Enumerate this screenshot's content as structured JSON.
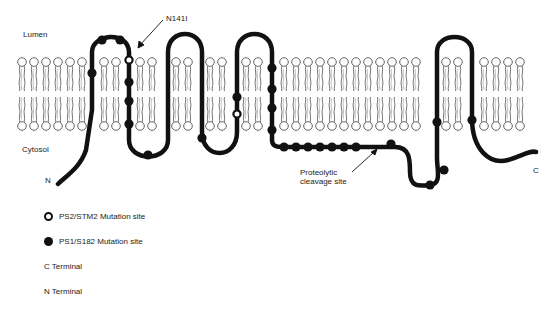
{
  "figure": {
    "compartments": {
      "lumen": "Lumen",
      "cytosol": "Cytosol"
    },
    "termini": {
      "n": "N",
      "c": "C"
    },
    "annotations": {
      "mutation_callout": "N141I",
      "cleavage_line1": "Proteolytic",
      "cleavage_line2": "cleavage site"
    },
    "legend": {
      "items": [
        {
          "symbol": "open-circle",
          "label": "PS2/STM2 Mutation site"
        },
        {
          "symbol": "filled-circle",
          "label": "PS1/S182 Mutation site"
        },
        {
          "symbol": "none",
          "label": "C Terminal"
        },
        {
          "symbol": "none",
          "label": "N Terminal"
        }
      ]
    },
    "colors": {
      "protein": "#111111",
      "lipid_outline": "#555555",
      "background": "#ffffff"
    }
  }
}
